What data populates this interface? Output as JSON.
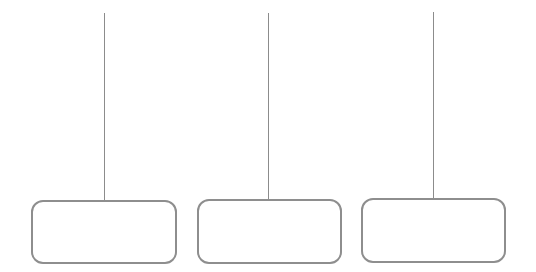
{
  "diagram": {
    "stroke_color": "#8e8e8e",
    "nodes": [
      {
        "id": "box-1",
        "label": "",
        "line_x": 104,
        "line_top": 13,
        "line_bottom": 201,
        "box": {
          "left": 31,
          "top": 200,
          "width": 146,
          "height": 64
        }
      },
      {
        "id": "box-2",
        "label": "",
        "line_x": 268,
        "line_top": 13,
        "line_bottom": 200,
        "box": {
          "left": 197,
          "top": 199,
          "width": 145,
          "height": 65
        }
      },
      {
        "id": "box-3",
        "label": "",
        "line_x": 433,
        "line_top": 12,
        "line_bottom": 199,
        "box": {
          "left": 361,
          "top": 198,
          "width": 145,
          "height": 65
        }
      }
    ]
  }
}
